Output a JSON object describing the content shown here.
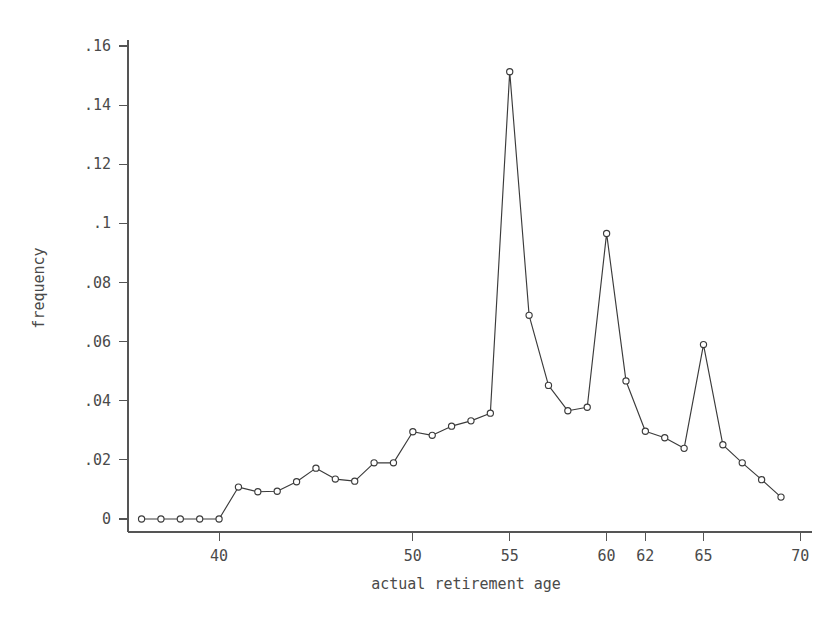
{
  "chart_data": {
    "type": "line",
    "title": "",
    "xlabel": "actual retirement age",
    "ylabel": "frequency",
    "xlim": [
      35.3,
      70.6
    ],
    "ylim": [
      0,
      0.167
    ],
    "grid": false,
    "legend": "none",
    "marker": "open-circle",
    "x": [
      36,
      37,
      38,
      39,
      40,
      41,
      42,
      43,
      44,
      45,
      46,
      47,
      48,
      49,
      50,
      51,
      52,
      53,
      54,
      55,
      56,
      57,
      58,
      59,
      60,
      61,
      62,
      63,
      64,
      65,
      66,
      67,
      68,
      69
    ],
    "values": [
      0,
      0,
      0,
      0,
      0,
      0.0108,
      0.0092,
      0.0094,
      0.0126,
      0.0172,
      0.0135,
      0.0128,
      0.019,
      0.019,
      0.0295,
      0.0283,
      0.0314,
      0.0332,
      0.0358,
      0.1513,
      0.0689,
      0.0452,
      0.0366,
      0.0378,
      0.0966,
      0.0467,
      0.0297,
      0.0275,
      0.0239,
      0.059,
      0.0251,
      0.019,
      0.0133,
      0.0074
    ],
    "xticks": [
      40,
      50,
      55,
      60,
      62,
      65,
      70
    ],
    "xticklabels": [
      "40",
      "50",
      "55",
      "60",
      "62",
      "65",
      "70"
    ],
    "yticks": [
      0,
      0.02,
      0.04,
      0.06,
      0.08,
      0.1,
      0.12,
      0.14,
      0.16
    ],
    "yticklabels": [
      "0",
      ".02",
      ".04",
      ".06",
      ".08",
      ".1",
      ".12",
      ".14",
      ".16"
    ]
  },
  "colors": {
    "background": "#ffffff",
    "axis": "#555555",
    "line": "#3b3b3b",
    "marker_fill": "#ffffff",
    "text": "#4a4a4a"
  }
}
